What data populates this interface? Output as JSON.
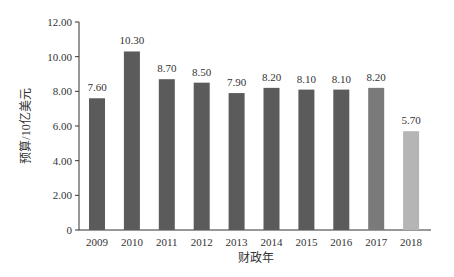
{
  "chart_data": {
    "type": "bar",
    "title": "",
    "xlabel": "财政年",
    "ylabel": "预算/10亿美元",
    "categories": [
      "2009",
      "2010",
      "2011",
      "2012",
      "2013",
      "2014",
      "2015",
      "2016",
      "2017",
      "2018"
    ],
    "values": [
      7.6,
      10.3,
      8.7,
      8.5,
      7.9,
      8.2,
      8.1,
      8.1,
      8.2,
      5.7
    ],
    "value_labels": [
      "7.60",
      "10.30",
      "8.70",
      "8.50",
      "7.90",
      "8.20",
      "8.10",
      "8.10",
      "8.20",
      "5.70"
    ],
    "bar_colors": [
      "#5b5b5b",
      "#5b5b5b",
      "#5b5b5b",
      "#5b5b5b",
      "#5b5b5b",
      "#5b5b5b",
      "#5b5b5b",
      "#5b5b5b",
      "#7a7a7a",
      "#b5b5b5"
    ],
    "ylim": [
      0,
      12
    ],
    "yticks": [
      0,
      2,
      4,
      6,
      8,
      10,
      12
    ],
    "ytick_labels": [
      "0",
      "2.00",
      "4.00",
      "6.00",
      "8.00",
      "10.00",
      "12.00"
    ],
    "grid": false,
    "legend": null
  }
}
